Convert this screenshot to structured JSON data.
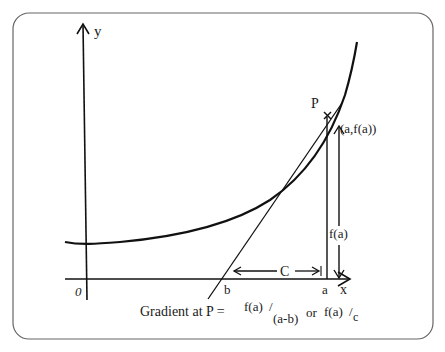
{
  "diagram": {
    "axes": {
      "x_label": "x",
      "y_label": "y",
      "origin_label": "0"
    },
    "points": {
      "p_label": "P",
      "p_coords": "(a,f(a))",
      "a_label": "a",
      "b_label": "b"
    },
    "measures": {
      "height_label": "f(a)",
      "base_label": "C"
    },
    "caption": {
      "prefix": "Gradient at P =",
      "num1": "f(a)",
      "slash1": "/",
      "den1": "(a-b)",
      "or": "or",
      "num2": "f(a)",
      "slash2": "/",
      "den2": "c"
    },
    "colors": {
      "stroke": "#111111",
      "frame": "#555555"
    }
  }
}
